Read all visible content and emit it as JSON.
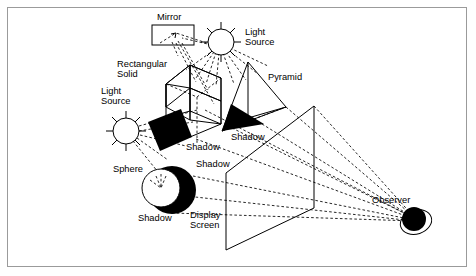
{
  "diagram": {
    "labels": {
      "mirror": "Mirror",
      "light_source_top": "Light\nSource",
      "light_source_top_line1": "Light",
      "light_source_top_line2": "Source",
      "light_source_left_line1": "Light",
      "light_source_left_line2": "Source",
      "rectangular_solid_line1": "Rectangular",
      "rectangular_solid_line2": "Solid",
      "pyramid": "Pyramid",
      "sphere": "Sphere",
      "shadow_cube": "Shadow",
      "shadow_pyramid": "Shadow",
      "shadow_mid": "Shadow",
      "shadow_sphere": "Shadow",
      "display_screen_line1": "Display",
      "display_screen_line2": "Screen",
      "observer": "Observer"
    },
    "colors": {
      "ink": "#000000",
      "border": "#9a9a9a",
      "background": "#ffffff"
    },
    "objects": [
      {
        "name": "mirror",
        "type": "rectangle"
      },
      {
        "name": "light-source-top",
        "type": "sun"
      },
      {
        "name": "light-source-left",
        "type": "sun"
      },
      {
        "name": "rectangular-solid",
        "type": "wireframe-cube"
      },
      {
        "name": "pyramid",
        "type": "wireframe-pyramid"
      },
      {
        "name": "sphere",
        "type": "circle"
      },
      {
        "name": "display-screen",
        "type": "parallelogram"
      },
      {
        "name": "observer",
        "type": "filled-circle"
      }
    ]
  }
}
